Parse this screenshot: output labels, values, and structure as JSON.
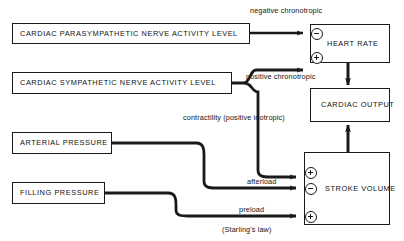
{
  "diagram": {
    "background_color": "#ffffff",
    "line_color": "#1a1a1a",
    "nodes": [
      {
        "id": "parasympathetic",
        "label": "CARDIAC PARASYMPATHETIC NERVE ACTIVITY LEVEL"
      },
      {
        "id": "sympathetic",
        "label": "CARDIAC SYMPATHETIC NERVE ACTIVITY LEVEL"
      },
      {
        "id": "arterial",
        "label": "ARTERIAL PRESSURE"
      },
      {
        "id": "filling",
        "label": "FILLING PRESSURE"
      },
      {
        "id": "heart_rate",
        "label": "HEART RATE"
      },
      {
        "id": "cardiac_output",
        "label": "CARDIAC OUTPUT"
      },
      {
        "id": "stroke_volume",
        "label": "STROKE VOLUME"
      }
    ],
    "edge_labels": {
      "negative_chronotropic": "negative chronotropic",
      "positive_chronotropic": "positive chronotropic",
      "contractility": "contractility (positive inotropic)",
      "afterload": "afterload",
      "preload": "preload",
      "starling": "(Starling's law)"
    },
    "signs": {
      "hr_negative": "⊖",
      "hr_positive": "⊕",
      "sv_contractility": "⊕",
      "sv_afterload": "⊖",
      "sv_preload": "⊕"
    }
  }
}
